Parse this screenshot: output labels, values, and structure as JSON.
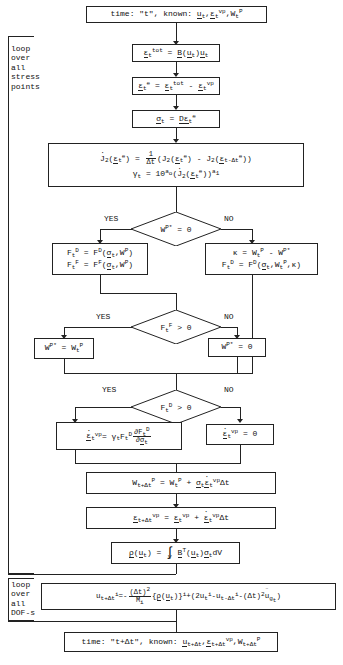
{
  "diagram": {
    "title_top": "time: \"t\", known: u_t, e_t^vp, W_t^P",
    "title_bottom": "time: \"t+Dt\", known: u_{t+Dt}, e_{t+Dt}^vp, W_{t+Dt}^P"
  },
  "loops": {
    "stress": {
      "lines": [
        "loop",
        "over",
        "all",
        "stress",
        "points"
      ]
    },
    "dof": {
      "lines": [
        "loop",
        "over",
        "all",
        "DOF-s"
      ]
    }
  },
  "labels": {
    "yes": "YES",
    "no": "NO"
  },
  "nodes": {
    "start": {
      "name": "time-known-start",
      "text": "time: \"t\", known: u_t , e_t^vp , W_t^P"
    },
    "strain_tot": {
      "name": "total-strain",
      "text": "e_t^tot = B(u_t) u_t"
    },
    "strain_elastic": {
      "name": "elastic-strain",
      "text": "e_t^e = e_t^tot - e_t^vp"
    },
    "stress": {
      "name": "stress-update",
      "text": "s_t = D e_t^e"
    },
    "j2": {
      "name": "j2-invariant-rate",
      "line1": "J2dot(e_t^e) = (1/Dt)(J2(e_t^e) - J2(e_{t-Dt}^e))",
      "line2": "gamma_t = 10^{a_o} (J2dot(e_t^e))^{a_1}"
    },
    "decision_wp": {
      "name": "decision-wp-star-zero",
      "text": "W^P* = 0"
    },
    "yes_branch": {
      "name": "failure-functions-box",
      "line1": "F_t^D = F^D(s_t , W^P)",
      "line2": "F_t^F = F^F(s_t , W^P)"
    },
    "no_branch": {
      "name": "kappa-damage-box",
      "line1": "k = W_t^P - W^P*",
      "line2": "F_t^D = F^D(s_t , W_t^P , k)"
    },
    "decision_ff": {
      "name": "decision-ff-positive",
      "text": "F_t^F > 0"
    },
    "wp_assign_yes": {
      "name": "wp-star-assign",
      "text": "W^P* = W_t^P"
    },
    "wp_assign_no": {
      "name": "wp-star-zero",
      "text": "W^P* = 0"
    },
    "decision_fd": {
      "name": "decision-fd-positive",
      "text": "F_t^D > 0"
    },
    "vp_rate_yes": {
      "name": "viscoplastic-strain-rate",
      "text": "e_t^vpdot = gamma_t F_t^D dF_t^D/ds_t"
    },
    "vp_rate_no": {
      "name": "viscoplastic-strain-rate-zero",
      "text": "e_t^vpdot = 0"
    },
    "wp_update": {
      "name": "plastic-work-update",
      "text": "W_{t+Dt}^P = W_t^P + s_t e_t^vpdot Dt"
    },
    "vp_update": {
      "name": "viscoplastic-strain-update",
      "text": "e_{t+Dt}^vp = e_t^vp + e_t^vpdot Dt"
    },
    "internal_force": {
      "name": "internal-force-integral",
      "text": "r(u_t) = Int_V B^T(u_t) s_t dV"
    },
    "displacement": {
      "name": "displacement-update",
      "text": "u_{t+Dt}^i = -((Dt)^2/M_i){r(u_t)}^i + (2u_t^i - u_{t-Dt}^i - (Dt)^2 ug_t)"
    },
    "end": {
      "name": "time-known-end",
      "text": "time: \"t+Dt\", known: u_{t+Dt} , e_{t+Dt}^vp , W_{t+Dt}^P"
    }
  }
}
